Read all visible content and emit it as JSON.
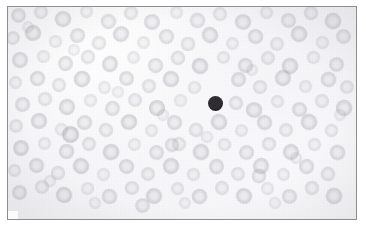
{
  "image": {
    "kind": "micrograph",
    "subject": "peripheral-blood-smear",
    "caption": "",
    "width": 366,
    "height": 232,
    "background_color": "#ffffff"
  },
  "plate": {
    "left": 7,
    "top": 6,
    "width": 350,
    "height": 214,
    "border_color": "#8d8d90",
    "border_width": 1,
    "field_color": "#f5f4f6"
  },
  "palette": {
    "field_background": "#f5f4f6",
    "erythrocyte_fill": "#cfcdd6",
    "erythrocyte_rim": "#b9b7c3",
    "erythrocyte_center_pallor": "#e4e3e9",
    "dark_cell_fill": "#2e2c30",
    "dark_cell_rim": "#1a181b",
    "frame_border": "#8d8d90"
  },
  "features": {
    "dark_cell": {
      "label": "dark-stained-nucleated-cell",
      "center_x": 215,
      "center_y": 103,
      "diameter": 15,
      "color": "#2e2c30"
    },
    "erythrocyte_count_visible": 268,
    "erythrocyte_diameter_range": [
      11,
      19
    ]
  },
  "erythrocytes": [
    {
      "x": 18,
      "y": 15,
      "d": 15,
      "t": 0.52,
      "r": 12
    },
    {
      "x": 41,
      "y": 12,
      "d": 14,
      "t": 0.44,
      "r": 40
    },
    {
      "x": 63,
      "y": 19,
      "d": 16,
      "t": 0.58,
      "r": 75
    },
    {
      "x": 86,
      "y": 11,
      "d": 13,
      "t": 0.4,
      "r": 110
    },
    {
      "x": 108,
      "y": 21,
      "d": 15,
      "t": 0.5,
      "r": 8
    },
    {
      "x": 131,
      "y": 13,
      "d": 14,
      "t": 0.46,
      "r": 55
    },
    {
      "x": 152,
      "y": 22,
      "d": 16,
      "t": 0.55,
      "r": 92
    },
    {
      "x": 176,
      "y": 12,
      "d": 13,
      "t": 0.38,
      "r": 130
    },
    {
      "x": 197,
      "y": 20,
      "d": 15,
      "t": 0.49,
      "r": 20
    },
    {
      "x": 220,
      "y": 14,
      "d": 14,
      "t": 0.43,
      "r": 64
    },
    {
      "x": 243,
      "y": 22,
      "d": 16,
      "t": 0.57,
      "r": 100
    },
    {
      "x": 266,
      "y": 12,
      "d": 13,
      "t": 0.41,
      "r": 142
    },
    {
      "x": 288,
      "y": 20,
      "d": 15,
      "t": 0.51,
      "r": 30
    },
    {
      "x": 311,
      "y": 13,
      "d": 14,
      "t": 0.45,
      "r": 70
    },
    {
      "x": 333,
      "y": 21,
      "d": 16,
      "t": 0.56,
      "r": 115
    },
    {
      "x": 13,
      "y": 38,
      "d": 14,
      "t": 0.47,
      "r": 25
    },
    {
      "x": 33,
      "y": 33,
      "d": 16,
      "t": 0.6,
      "r": 60
    },
    {
      "x": 55,
      "y": 41,
      "d": 13,
      "t": 0.39,
      "r": 95
    },
    {
      "x": 77,
      "y": 35,
      "d": 15,
      "t": 0.53,
      "r": 135
    },
    {
      "x": 99,
      "y": 43,
      "d": 14,
      "t": 0.44,
      "r": 15
    },
    {
      "x": 121,
      "y": 34,
      "d": 16,
      "t": 0.59,
      "r": 50
    },
    {
      "x": 143,
      "y": 42,
      "d": 13,
      "t": 0.37,
      "r": 85
    },
    {
      "x": 166,
      "y": 36,
      "d": 15,
      "t": 0.52,
      "r": 120
    },
    {
      "x": 188,
      "y": 44,
      "d": 14,
      "t": 0.46,
      "r": 5
    },
    {
      "x": 210,
      "y": 35,
      "d": 16,
      "t": 0.58,
      "r": 45
    },
    {
      "x": 232,
      "y": 43,
      "d": 13,
      "t": 0.4,
      "r": 80
    },
    {
      "x": 255,
      "y": 36,
      "d": 15,
      "t": 0.54,
      "r": 118
    },
    {
      "x": 277,
      "y": 44,
      "d": 14,
      "t": 0.43,
      "r": 160
    },
    {
      "x": 299,
      "y": 34,
      "d": 16,
      "t": 0.57,
      "r": 35
    },
    {
      "x": 322,
      "y": 42,
      "d": 13,
      "t": 0.38,
      "r": 72
    },
    {
      "x": 343,
      "y": 36,
      "d": 15,
      "t": 0.51,
      "r": 105
    },
    {
      "x": 20,
      "y": 60,
      "d": 16,
      "t": 0.55,
      "r": 18
    },
    {
      "x": 43,
      "y": 56,
      "d": 13,
      "t": 0.41,
      "r": 58
    },
    {
      "x": 65,
      "y": 63,
      "d": 15,
      "t": 0.53,
      "r": 96
    },
    {
      "x": 88,
      "y": 57,
      "d": 14,
      "t": 0.45,
      "r": 133
    },
    {
      "x": 110,
      "y": 64,
      "d": 16,
      "t": 0.6,
      "r": 22
    },
    {
      "x": 133,
      "y": 57,
      "d": 13,
      "t": 0.39,
      "r": 66
    },
    {
      "x": 155,
      "y": 65,
      "d": 15,
      "t": 0.52,
      "r": 102
    },
    {
      "x": 178,
      "y": 58,
      "d": 14,
      "t": 0.47,
      "r": 141
    },
    {
      "x": 200,
      "y": 66,
      "d": 16,
      "t": 0.62,
      "r": 28
    },
    {
      "x": 223,
      "y": 57,
      "d": 13,
      "t": 0.42,
      "r": 68
    },
    {
      "x": 245,
      "y": 65,
      "d": 15,
      "t": 0.54,
      "r": 109
    },
    {
      "x": 268,
      "y": 58,
      "d": 14,
      "t": 0.44,
      "r": 150
    },
    {
      "x": 290,
      "y": 66,
      "d": 16,
      "t": 0.59,
      "r": 32
    },
    {
      "x": 313,
      "y": 57,
      "d": 13,
      "t": 0.4,
      "r": 77
    },
    {
      "x": 336,
      "y": 64,
      "d": 15,
      "t": 0.53,
      "r": 113
    },
    {
      "x": 15,
      "y": 82,
      "d": 13,
      "t": 0.42,
      "r": 10
    },
    {
      "x": 37,
      "y": 78,
      "d": 15,
      "t": 0.56,
      "r": 48
    },
    {
      "x": 59,
      "y": 85,
      "d": 14,
      "t": 0.46,
      "r": 88
    },
    {
      "x": 82,
      "y": 79,
      "d": 16,
      "t": 0.61,
      "r": 124
    },
    {
      "x": 104,
      "y": 87,
      "d": 13,
      "t": 0.38,
      "r": 2
    },
    {
      "x": 126,
      "y": 78,
      "d": 15,
      "t": 0.55,
      "r": 42
    },
    {
      "x": 149,
      "y": 86,
      "d": 14,
      "t": 0.48,
      "r": 79
    },
    {
      "x": 171,
      "y": 79,
      "d": 16,
      "t": 0.6,
      "r": 117
    },
    {
      "x": 194,
      "y": 87,
      "d": 13,
      "t": 0.41,
      "r": 155
    },
    {
      "x": 238,
      "y": 79,
      "d": 15,
      "t": 0.57,
      "r": 38
    },
    {
      "x": 260,
      "y": 87,
      "d": 14,
      "t": 0.45,
      "r": 74
    },
    {
      "x": 283,
      "y": 78,
      "d": 16,
      "t": 0.58,
      "r": 112
    },
    {
      "x": 305,
      "y": 86,
      "d": 13,
      "t": 0.39,
      "r": 148
    },
    {
      "x": 328,
      "y": 79,
      "d": 15,
      "t": 0.54,
      "r": 26
    },
    {
      "x": 347,
      "y": 87,
      "d": 14,
      "t": 0.47,
      "r": 62
    },
    {
      "x": 22,
      "y": 104,
      "d": 15,
      "t": 0.54,
      "r": 36
    },
    {
      "x": 45,
      "y": 99,
      "d": 14,
      "t": 0.44,
      "r": 71
    },
    {
      "x": 67,
      "y": 107,
      "d": 16,
      "t": 0.59,
      "r": 106
    },
    {
      "x": 90,
      "y": 100,
      "d": 13,
      "t": 0.4,
      "r": 144
    },
    {
      "x": 112,
      "y": 108,
      "d": 15,
      "t": 0.52,
      "r": 16
    },
    {
      "x": 135,
      "y": 100,
      "d": 14,
      "t": 0.46,
      "r": 53
    },
    {
      "x": 157,
      "y": 108,
      "d": 16,
      "t": 0.61,
      "r": 90
    },
    {
      "x": 180,
      "y": 100,
      "d": 13,
      "t": 0.37,
      "r": 127
    },
    {
      "x": 236,
      "y": 103,
      "d": 14,
      "t": 0.48,
      "r": 59
    },
    {
      "x": 254,
      "y": 110,
      "d": 16,
      "t": 0.58,
      "r": 98
    },
    {
      "x": 277,
      "y": 101,
      "d": 13,
      "t": 0.42,
      "r": 136
    },
    {
      "x": 299,
      "y": 109,
      "d": 15,
      "t": 0.55,
      "r": 24
    },
    {
      "x": 322,
      "y": 101,
      "d": 14,
      "t": 0.43,
      "r": 63
    },
    {
      "x": 344,
      "y": 108,
      "d": 16,
      "t": 0.57,
      "r": 101
    },
    {
      "x": 16,
      "y": 126,
      "d": 14,
      "t": 0.45,
      "r": 44
    },
    {
      "x": 39,
      "y": 121,
      "d": 16,
      "t": 0.6,
      "r": 82
    },
    {
      "x": 61,
      "y": 129,
      "d": 13,
      "t": 0.38,
      "r": 119
    },
    {
      "x": 84,
      "y": 122,
      "d": 15,
      "t": 0.53,
      "r": 157
    },
    {
      "x": 106,
      "y": 130,
      "d": 14,
      "t": 0.47,
      "r": 33
    },
    {
      "x": 129,
      "y": 122,
      "d": 16,
      "t": 0.62,
      "r": 69
    },
    {
      "x": 151,
      "y": 130,
      "d": 13,
      "t": 0.4,
      "r": 104
    },
    {
      "x": 174,
      "y": 122,
      "d": 15,
      "t": 0.54,
      "r": 139
    },
    {
      "x": 196,
      "y": 130,
      "d": 14,
      "t": 0.46,
      "r": 14
    },
    {
      "x": 219,
      "y": 122,
      "d": 16,
      "t": 0.59,
      "r": 51
    },
    {
      "x": 241,
      "y": 130,
      "d": 13,
      "t": 0.39,
      "r": 87
    },
    {
      "x": 264,
      "y": 122,
      "d": 15,
      "t": 0.56,
      "r": 123
    },
    {
      "x": 286,
      "y": 130,
      "d": 14,
      "t": 0.44,
      "r": 159
    },
    {
      "x": 309,
      "y": 122,
      "d": 16,
      "t": 0.58,
      "r": 41
    },
    {
      "x": 331,
      "y": 130,
      "d": 13,
      "t": 0.41,
      "r": 78
    },
    {
      "x": 21,
      "y": 148,
      "d": 16,
      "t": 0.63,
      "r": 7
    },
    {
      "x": 44,
      "y": 143,
      "d": 13,
      "t": 0.4,
      "r": 46
    },
    {
      "x": 66,
      "y": 151,
      "d": 15,
      "t": 0.55,
      "r": 83
    },
    {
      "x": 89,
      "y": 144,
      "d": 14,
      "t": 0.47,
      "r": 121
    },
    {
      "x": 111,
      "y": 152,
      "d": 16,
      "t": 0.61,
      "r": 158
    },
    {
      "x": 134,
      "y": 144,
      "d": 13,
      "t": 0.38,
      "r": 37
    },
    {
      "x": 156,
      "y": 152,
      "d": 15,
      "t": 0.53,
      "r": 73
    },
    {
      "x": 179,
      "y": 144,
      "d": 14,
      "t": 0.45,
      "r": 111
    },
    {
      "x": 201,
      "y": 152,
      "d": 16,
      "t": 0.6,
      "r": 147
    },
    {
      "x": 224,
      "y": 144,
      "d": 13,
      "t": 0.42,
      "r": 27
    },
    {
      "x": 246,
      "y": 152,
      "d": 15,
      "t": 0.54,
      "r": 65
    },
    {
      "x": 269,
      "y": 144,
      "d": 14,
      "t": 0.46,
      "r": 99
    },
    {
      "x": 291,
      "y": 152,
      "d": 16,
      "t": 0.59,
      "r": 134
    },
    {
      "x": 314,
      "y": 144,
      "d": 13,
      "t": 0.39,
      "r": 19
    },
    {
      "x": 337,
      "y": 152,
      "d": 15,
      "t": 0.52,
      "r": 56
    },
    {
      "x": 14,
      "y": 170,
      "d": 13,
      "t": 0.43,
      "r": 93
    },
    {
      "x": 36,
      "y": 165,
      "d": 15,
      "t": 0.57,
      "r": 129
    },
    {
      "x": 58,
      "y": 173,
      "d": 14,
      "t": 0.45,
      "r": 4
    },
    {
      "x": 81,
      "y": 166,
      "d": 16,
      "t": 0.62,
      "r": 43
    },
    {
      "x": 103,
      "y": 174,
      "d": 13,
      "t": 0.37,
      "r": 80
    },
    {
      "x": 126,
      "y": 166,
      "d": 15,
      "t": 0.56,
      "r": 116
    },
    {
      "x": 148,
      "y": 174,
      "d": 14,
      "t": 0.48,
      "r": 152
    },
    {
      "x": 171,
      "y": 166,
      "d": 16,
      "t": 0.6,
      "r": 31
    },
    {
      "x": 193,
      "y": 174,
      "d": 13,
      "t": 0.41,
      "r": 67
    },
    {
      "x": 216,
      "y": 166,
      "d": 15,
      "t": 0.55,
      "r": 103
    },
    {
      "x": 238,
      "y": 174,
      "d": 14,
      "t": 0.44,
      "r": 138
    },
    {
      "x": 261,
      "y": 166,
      "d": 16,
      "t": 0.58,
      "r": 23
    },
    {
      "x": 283,
      "y": 174,
      "d": 13,
      "t": 0.4,
      "r": 61
    },
    {
      "x": 306,
      "y": 166,
      "d": 15,
      "t": 0.53,
      "r": 97
    },
    {
      "x": 328,
      "y": 174,
      "d": 14,
      "t": 0.46,
      "r": 131
    },
    {
      "x": 19,
      "y": 192,
      "d": 15,
      "t": 0.56,
      "r": 54
    },
    {
      "x": 42,
      "y": 187,
      "d": 14,
      "t": 0.44,
      "r": 91
    },
    {
      "x": 64,
      "y": 195,
      "d": 16,
      "t": 0.61,
      "r": 126
    },
    {
      "x": 87,
      "y": 188,
      "d": 13,
      "t": 0.39,
      "r": 161
    },
    {
      "x": 109,
      "y": 196,
      "d": 15,
      "t": 0.54,
      "r": 49
    },
    {
      "x": 132,
      "y": 188,
      "d": 14,
      "t": 0.47,
      "r": 86
    },
    {
      "x": 154,
      "y": 196,
      "d": 16,
      "t": 0.59,
      "r": 122
    },
    {
      "x": 177,
      "y": 188,
      "d": 13,
      "t": 0.42,
      "r": 9
    },
    {
      "x": 199,
      "y": 196,
      "d": 15,
      "t": 0.55,
      "r": 47
    },
    {
      "x": 222,
      "y": 188,
      "d": 14,
      "t": 0.45,
      "r": 84
    },
    {
      "x": 244,
      "y": 196,
      "d": 16,
      "t": 0.6,
      "r": 120
    },
    {
      "x": 267,
      "y": 188,
      "d": 13,
      "t": 0.38,
      "r": 156
    },
    {
      "x": 289,
      "y": 196,
      "d": 15,
      "t": 0.52,
      "r": 34
    },
    {
      "x": 312,
      "y": 188,
      "d": 14,
      "t": 0.46,
      "r": 76
    },
    {
      "x": 334,
      "y": 196,
      "d": 16,
      "t": 0.57,
      "r": 108
    },
    {
      "x": 28,
      "y": 27,
      "d": 12,
      "t": 0.35,
      "r": 17
    },
    {
      "x": 74,
      "y": 50,
      "d": 12,
      "t": 0.34,
      "r": 57
    },
    {
      "x": 118,
      "y": 92,
      "d": 12,
      "t": 0.36,
      "r": 94
    },
    {
      "x": 163,
      "y": 115,
      "d": 12,
      "t": 0.33,
      "r": 128
    },
    {
      "x": 207,
      "y": 137,
      "d": 12,
      "t": 0.35,
      "r": 11
    },
    {
      "x": 252,
      "y": 70,
      "d": 12,
      "t": 0.34,
      "r": 52
    },
    {
      "x": 296,
      "y": 158,
      "d": 12,
      "t": 0.36,
      "r": 89
    },
    {
      "x": 340,
      "y": 115,
      "d": 12,
      "t": 0.33,
      "r": 125
    },
    {
      "x": 50,
      "y": 181,
      "d": 12,
      "t": 0.35,
      "r": 6
    },
    {
      "x": 95,
      "y": 203,
      "d": 12,
      "t": 0.34,
      "r": 42
    },
    {
      "x": 185,
      "y": 203,
      "d": 12,
      "t": 0.36,
      "r": 114
    },
    {
      "x": 275,
      "y": 203,
      "d": 12,
      "t": 0.33,
      "r": 146
    },
    {
      "x": 70,
      "y": 134,
      "d": 17,
      "t": 0.72,
      "r": 25
    },
    {
      "x": 172,
      "y": 145,
      "d": 14,
      "t": 0.5,
      "r": 60
    },
    {
      "x": 259,
      "y": 176,
      "d": 14,
      "t": 0.49,
      "r": 95
    },
    {
      "x": 142,
      "y": 205,
      "d": 15,
      "t": 0.51,
      "r": 130
    }
  ]
}
